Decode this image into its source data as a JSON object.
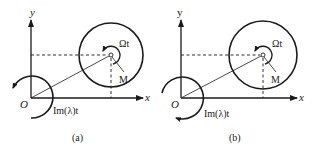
{
  "panels": [
    {
      "id": "a",
      "caption": "(a)",
      "axis_x_label": "x",
      "axis_y_label": "y",
      "origin_label": "O",
      "spin_label": "Ωt",
      "point_label": "M",
      "orbit_label": "Im(λ)t",
      "orbit_rotation": "counterclockwise",
      "spin_rotation": "counterclockwise"
    },
    {
      "id": "b",
      "caption": "(b)",
      "axis_x_label": "x",
      "axis_y_label": "y",
      "origin_label": "O",
      "spin_label": "Ωt",
      "point_label": "M",
      "orbit_label": "Im(λ)t",
      "orbit_rotation": "clockwise",
      "spin_rotation": "counterclockwise"
    }
  ],
  "colors": {
    "ink": "#1a1a1a",
    "background": "#ffffff"
  }
}
